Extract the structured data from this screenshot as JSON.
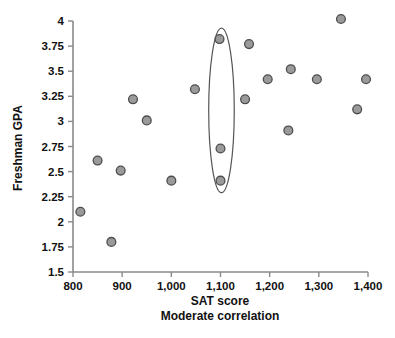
{
  "chart_data": {
    "type": "scatter",
    "title": "",
    "xlabel": "SAT score",
    "ylabel": "Freshman GPA",
    "subtitle": "Moderate correlation",
    "xlim": [
      800,
      1400
    ],
    "ylim": [
      1.5,
      4
    ],
    "grid": false,
    "legend": false,
    "xticks": [
      800,
      900,
      1000,
      1100,
      1200,
      1300,
      1400
    ],
    "xticklabels": [
      "800",
      "900",
      "1,000",
      "1,100",
      "1,200",
      "1,300",
      "1,400"
    ],
    "yticks": [
      1.5,
      1.75,
      2,
      2.25,
      2.5,
      2.75,
      3,
      3.25,
      3.5,
      3.75,
      4
    ],
    "yticklabels": [
      "1.5",
      "1.75",
      "2",
      "2.25",
      "2.5",
      "2.75",
      "3",
      "3.25",
      "3.5",
      "3.75",
      "4"
    ],
    "points": [
      {
        "x": 815,
        "y": 2.1
      },
      {
        "x": 850,
        "y": 2.61
      },
      {
        "x": 878,
        "y": 1.8
      },
      {
        "x": 897,
        "y": 2.51
      },
      {
        "x": 922,
        "y": 3.22
      },
      {
        "x": 950,
        "y": 3.01
      },
      {
        "x": 1000,
        "y": 2.41
      },
      {
        "x": 1048,
        "y": 3.32
      },
      {
        "x": 1098,
        "y": 3.82
      },
      {
        "x": 1100,
        "y": 2.73
      },
      {
        "x": 1100,
        "y": 2.41
      },
      {
        "x": 1150,
        "y": 3.22
      },
      {
        "x": 1158,
        "y": 3.77
      },
      {
        "x": 1196,
        "y": 3.42
      },
      {
        "x": 1238,
        "y": 2.91
      },
      {
        "x": 1243,
        "y": 3.52
      },
      {
        "x": 1296,
        "y": 3.42
      },
      {
        "x": 1345,
        "y": 4.02
      },
      {
        "x": 1378,
        "y": 3.12
      },
      {
        "x": 1396,
        "y": 3.42
      }
    ],
    "annotation": {
      "name": "highlight-ellipse",
      "shape": "ellipse",
      "center_x": 1102,
      "center_y": 3.11,
      "radius_x": 26,
      "radius_y": 0.82,
      "encircled_points": [
        {
          "x": 1098,
          "y": 3.82
        },
        {
          "x": 1100,
          "y": 2.73
        },
        {
          "x": 1100,
          "y": 2.41
        }
      ]
    },
    "colors": {
      "marker_fill": "#9a9a9a",
      "marker_stroke": "#4d4d4d",
      "axis": "#8a8a8a",
      "text": "#111111",
      "background": "#ffffff"
    }
  }
}
